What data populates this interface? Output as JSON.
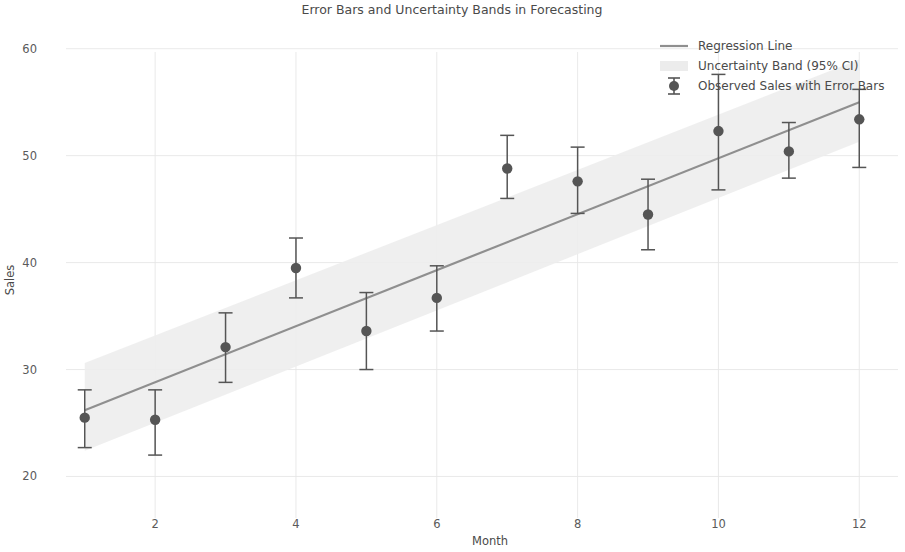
{
  "chart_data": {
    "type": "scatter",
    "title": "Error Bars and Uncertainty Bands in Forecasting",
    "xlabel": "Month",
    "ylabel": "Sales",
    "xlim": [
      0.45,
      12.55
    ],
    "ylim": [
      17.8,
      62.5
    ],
    "xticks": [
      2,
      4,
      6,
      8,
      10,
      12
    ],
    "xtick_labels": [
      "2",
      "4",
      "6",
      "8",
      "10",
      "12"
    ],
    "yticks": [
      20,
      30,
      40,
      50,
      60
    ],
    "ytick_labels": [
      "20",
      "30",
      "40",
      "50",
      "60"
    ],
    "grid": true,
    "legend_position": "top-right",
    "x": [
      1,
      2,
      3,
      4,
      5,
      6,
      7,
      8,
      9,
      10,
      11,
      12
    ],
    "series": [
      {
        "name": "Observed Sales with Error Bars",
        "type": "scatter_errorbar",
        "color": "#555555",
        "values": [
          25.5,
          25.3,
          32.1,
          39.5,
          33.6,
          36.7,
          48.8,
          47.6,
          44.5,
          52.3,
          50.4,
          53.4
        ],
        "err_lower": [
          2.8,
          3.3,
          3.3,
          2.8,
          3.6,
          3.1,
          2.8,
          3.0,
          3.3,
          5.5,
          2.5,
          4.5
        ],
        "err_upper": [
          2.6,
          2.8,
          3.2,
          2.8,
          3.6,
          3.0,
          3.1,
          3.2,
          3.3,
          5.3,
          2.7,
          2.8
        ]
      },
      {
        "name": "Regression Line",
        "type": "line",
        "color": "#8f8f8f",
        "x_endpoints": [
          1,
          12
        ],
        "y_endpoints": [
          26.2,
          55.0
        ]
      },
      {
        "name": "Uncertainty Band (95% CI)",
        "type": "band",
        "color": "#ededed",
        "x_endpoints": [
          1,
          12
        ],
        "lower": [
          22.4,
          51.3
        ],
        "upper": [
          30.6,
          59.0
        ]
      }
    ],
    "legend_entries": [
      {
        "label": "Regression Line",
        "marker": "line",
        "color": "#8f8f8f"
      },
      {
        "label": "Uncertainty Band (95% CI)",
        "marker": "band",
        "color": "#ececec"
      },
      {
        "label": "Observed Sales with Error Bars",
        "marker": "errorbar-point",
        "color": "#555555"
      }
    ]
  },
  "axes": {
    "title": "Error Bars and Uncertainty Bands in Forecasting",
    "x_axis_label": "Month",
    "y_axis_label": "Sales"
  }
}
